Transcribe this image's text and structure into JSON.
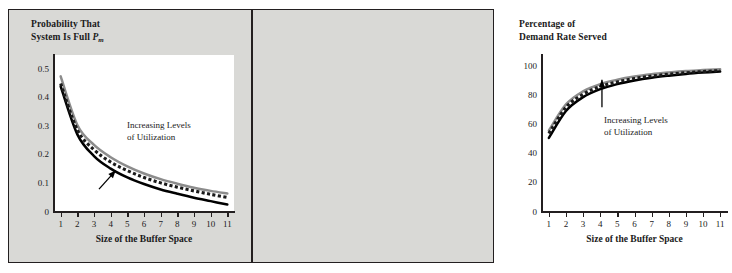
{
  "figure": {
    "background_color": "#d9d9d6",
    "border_color": "#231f20",
    "plot_background": "#ffffff"
  },
  "series_styles": {
    "high_utilization": "#8c8c8c",
    "medium_utilization": "#1a1a1a",
    "low_utilization": "#000000"
  },
  "panels": {
    "left": {
      "title_line1": "Probability That",
      "title_line2_prefix": "System Is Full ",
      "title_symbol": "P",
      "title_subscript": "m",
      "annotation_line1": "Increasing Levels",
      "annotation_line2": "of Utilization",
      "xlabel": "Size of the Buffer Space"
    },
    "right": {
      "title_line1": "Percentage of",
      "title_line2": "Demand Rate Served",
      "annotation_line1": "Increasing Levels",
      "annotation_line2": "of Utilization",
      "xlabel": "Size of the Buffer Space"
    }
  },
  "chart_data": [
    {
      "type": "line",
      "id": "probability-system-full",
      "title": "Probability That System Is Full P_m",
      "xlabel": "Size of the Buffer Space",
      "ylabel": "Probability That System Is Full P_m",
      "x": [
        1,
        2,
        3,
        4,
        5,
        6,
        7,
        8,
        9,
        10,
        11
      ],
      "xlim": [
        0.6,
        11.4
      ],
      "ylim": [
        0,
        0.55
      ],
      "xticks": [
        1,
        2,
        3,
        4,
        5,
        6,
        7,
        8,
        9,
        10,
        11
      ],
      "yticks": [
        0,
        0.1,
        0.2,
        0.3,
        0.4,
        0.5
      ],
      "ytick_labels": [
        "0",
        "0.1",
        "0.2",
        "0.3",
        "0.4",
        "0.5"
      ],
      "grid": false,
      "legend": "none",
      "annotations": [
        {
          "text": "Increasing Levels of Utilization",
          "arrow": "up-right",
          "arrow_from_x": 3.3,
          "arrow_from_y": 0.08,
          "arrow_to_x": 4.3,
          "arrow_to_y": 0.145
        }
      ],
      "series": [
        {
          "name": "Increasing Levels of Utilization (highest)",
          "style": "solid-gray",
          "color": "#8c8c8c",
          "values": [
            0.475,
            0.305,
            0.235,
            0.192,
            0.16,
            0.135,
            0.115,
            0.099,
            0.085,
            0.074,
            0.065
          ]
        },
        {
          "name": "Increasing Levels of Utilization (middle)",
          "style": "dotted-black",
          "color": "#1a1a1a",
          "values": [
            0.45,
            0.288,
            0.218,
            0.175,
            0.145,
            0.121,
            0.102,
            0.087,
            0.074,
            0.062,
            0.051
          ]
        },
        {
          "name": "Increasing Levels of Utilization (lowest)",
          "style": "solid-black",
          "color": "#000000",
          "values": [
            0.44,
            0.272,
            0.196,
            0.152,
            0.121,
            0.098,
            0.079,
            0.064,
            0.05,
            0.038,
            0.026
          ]
        }
      ]
    },
    {
      "type": "line",
      "id": "percentage-demand-rate-served",
      "title": "Percentage of Demand Rate Served",
      "xlabel": "Size of the Buffer Space",
      "ylabel": "Percentage of Demand Rate Served",
      "x": [
        1,
        2,
        3,
        4,
        5,
        6,
        7,
        8,
        9,
        10,
        11
      ],
      "xlim": [
        0.6,
        11.4
      ],
      "ylim": [
        0,
        108
      ],
      "xticks": [
        1,
        2,
        3,
        4,
        5,
        6,
        7,
        8,
        9,
        10,
        11
      ],
      "yticks": [
        0,
        20,
        40,
        60,
        80,
        100
      ],
      "ytick_labels": [
        "0",
        "20",
        "40",
        "60",
        "80",
        "100"
      ],
      "grid": false,
      "legend": "none",
      "annotations": [
        {
          "text": "Increasing Levels of Utilization",
          "arrow": "up",
          "arrow_from_x": 4.1,
          "arrow_from_y": 72,
          "arrow_to_x": 4.1,
          "arrow_to_y": 91
        }
      ],
      "series": [
        {
          "name": "Increasing Levels of Utilization (highest)",
          "style": "solid-gray",
          "color": "#8c8c8c",
          "values": [
            56.0,
            74.0,
            83.0,
            88.0,
            91.0,
            93.2,
            94.8,
            96.0,
            97.0,
            97.6,
            98.2
          ]
        },
        {
          "name": "Increasing Levels of Utilization (middle)",
          "style": "dotted-black",
          "color": "#1a1a1a",
          "values": [
            54.0,
            72.0,
            81.0,
            86.3,
            89.5,
            91.8,
            93.5,
            94.8,
            95.8,
            96.6,
            97.3
          ]
        },
        {
          "name": "Increasing Levels of Utilization (lowest)",
          "style": "solid-black",
          "color": "#000000",
          "values": [
            51.0,
            69.5,
            79.0,
            84.5,
            88.0,
            90.5,
            92.4,
            93.8,
            95.0,
            95.9,
            96.6
          ]
        }
      ]
    }
  ]
}
